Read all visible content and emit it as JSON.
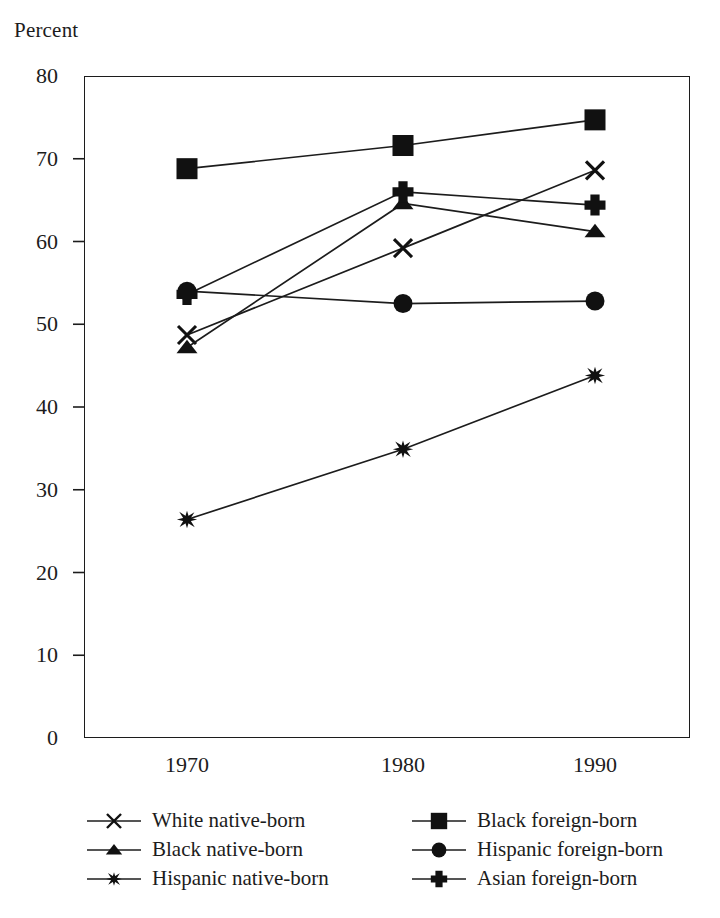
{
  "chart_data": {
    "type": "line",
    "title": "",
    "ylabel": "Percent",
    "xlabel": "",
    "categories": [
      "1970",
      "1980",
      "1990"
    ],
    "x": [
      1970,
      1980,
      1990
    ],
    "ylim": [
      0,
      80
    ],
    "yticks": [
      0,
      10,
      20,
      30,
      40,
      50,
      60,
      70,
      80
    ],
    "ytick_labels": [
      "0",
      "10",
      "20",
      "30",
      "40",
      "50",
      "60",
      "70",
      "80"
    ],
    "grid": false,
    "legend_position": "below-axes",
    "series": [
      {
        "name": "White native-born",
        "marker": "x-cross",
        "values": [
          48.7,
          59.2,
          68.6
        ]
      },
      {
        "name": "Black native-born",
        "marker": "triangle-up",
        "values": [
          47.2,
          64.6,
          61.2
        ]
      },
      {
        "name": "Hispanic native-born",
        "marker": "six-point-star",
        "values": [
          26.4,
          34.9,
          43.8
        ]
      },
      {
        "name": "Black foreign-born",
        "marker": "square",
        "values": [
          68.8,
          71.6,
          74.7
        ]
      },
      {
        "name": "Hispanic foreign-born",
        "marker": "circle",
        "values": [
          54.0,
          52.5,
          52.8
        ]
      },
      {
        "name": "Asian foreign-born",
        "marker": "plus-thick",
        "values": [
          53.6,
          66.0,
          64.4
        ]
      }
    ],
    "colors": {
      "line": "#1c1c1c",
      "marker": "#111111",
      "axis": "#1c1c1c",
      "background": "#ffffff"
    }
  },
  "legend": {
    "entries": [
      {
        "label": "White native-born",
        "marker": "x-cross"
      },
      {
        "label": "Black foreign-born",
        "marker": "square"
      },
      {
        "label": "Black native-born",
        "marker": "triangle-up"
      },
      {
        "label": "Hispanic foreign-born",
        "marker": "circle"
      },
      {
        "label": "Hispanic native-born",
        "marker": "six-point-star"
      },
      {
        "label": "Asian foreign-born",
        "marker": "plus-thick"
      }
    ]
  },
  "axes": {
    "y_title": "Percent",
    "x_tick_labels": [
      "1970",
      "1980",
      "1990"
    ],
    "y_tick_labels": [
      "80",
      "70",
      "60",
      "50",
      "40",
      "30",
      "20",
      "10",
      "0"
    ]
  }
}
